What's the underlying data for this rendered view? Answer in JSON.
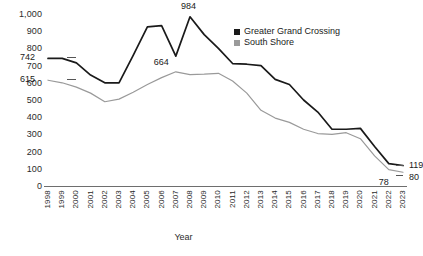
{
  "chart_data": {
    "type": "line",
    "title": "",
    "xlabel": "Year",
    "ylabel": "",
    "ylim": [
      0,
      1000
    ],
    "ytick_labels": [
      "1,000",
      "900",
      "800",
      "700",
      "600",
      "500",
      "400",
      "300",
      "200",
      "100",
      "0"
    ],
    "ytick_values": [
      1000,
      900,
      800,
      700,
      600,
      500,
      400,
      300,
      200,
      100,
      0
    ],
    "grid": false,
    "legend_position": "top-right",
    "categories": [
      "1998",
      "1999",
      "2000",
      "2001",
      "2002",
      "2003",
      "2004",
      "2005",
      "2006",
      "2007",
      "2008",
      "2009",
      "2010",
      "2011",
      "2012",
      "2013",
      "2014",
      "2015",
      "2016",
      "2017",
      "2018",
      "2019",
      "2020",
      "2021",
      "2022",
      "2023"
    ],
    "series": [
      {
        "name": "Greater Grand Crossing",
        "color": "#1a1a1a",
        "values": [
          742,
          742,
          716,
          645,
          600,
          600,
          760,
          925,
          932,
          755,
          984,
          880,
          800,
          712,
          708,
          700,
          620,
          590,
          500,
          430,
          330,
          330,
          335,
          230,
          130,
          119
        ]
      },
      {
        "name": "South Shore",
        "color": "#9a9a9a",
        "values": [
          615,
          600,
          575,
          540,
          490,
          505,
          545,
          590,
          630,
          664,
          648,
          650,
          655,
          610,
          540,
          440,
          395,
          370,
          330,
          305,
          300,
          310,
          275,
          175,
          95,
          80
        ]
      }
    ],
    "annotations": [
      {
        "text": "742",
        "series": "Greater Grand Crossing",
        "category": "1998",
        "value": 742
      },
      {
        "text": "615",
        "series": "South Shore",
        "category": "1998",
        "value": 615
      },
      {
        "text": "984",
        "series": "Greater Grand Crossing",
        "category": "2008",
        "value": 984
      },
      {
        "text": "664",
        "series": "South Shore",
        "category": "2007",
        "value": 664
      },
      {
        "text": "119",
        "series": "Greater Grand Crossing",
        "category": "2023",
        "value": 119
      },
      {
        "text": "80",
        "series": "South Shore",
        "category": "2023",
        "value": 80
      },
      {
        "text": "78",
        "series": "South Shore",
        "category": "2022",
        "value": 78
      }
    ]
  },
  "legend": {
    "items": [
      {
        "label": "Greater Grand Crossing",
        "color": "#1a1a1a"
      },
      {
        "label": "South Shore",
        "color": "#9a9a9a"
      }
    ]
  }
}
